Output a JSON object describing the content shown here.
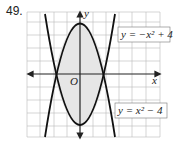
{
  "problem_number": "49.",
  "axes": {
    "x_label": "x",
    "y_label": "y",
    "origin_label": "O"
  },
  "curves": [
    {
      "name": "downward-parabola",
      "equation": "y = −x² + 4"
    },
    {
      "name": "upward-parabola",
      "equation": "y = x² − 4"
    }
  ],
  "region": {
    "description": "shaded region between the parabolas",
    "fill": "#e6e6e6"
  },
  "grid": {
    "x_range": [
      -6,
      4
    ],
    "y_range": [
      -5,
      5
    ]
  }
}
